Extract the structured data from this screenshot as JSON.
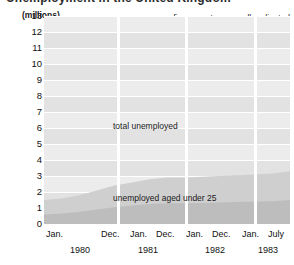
{
  "top_heading_clipped": "Unemployment in the United Kingdom",
  "chart_data": {
    "type": "area",
    "title": "",
    "subtitle": "",
    "note": "figures not seasonally adjusted",
    "ylabel": "(millions)",
    "xlabel": "",
    "ylim": [
      0,
      13
    ],
    "grid": true,
    "legend_position": "inline",
    "y_ticks": [
      "13",
      "12",
      "11",
      "10",
      "9",
      "8",
      "7",
      "6",
      "5",
      "4",
      "3",
      "2",
      "1",
      "0"
    ],
    "y_tick_values": [
      13,
      12,
      11,
      10,
      9,
      8,
      7,
      6,
      5,
      4,
      3,
      2,
      1,
      0
    ],
    "x_tick_labels": [
      "Jan.",
      "Dec.",
      "Jan.",
      "Dec.",
      "Jan.",
      "Dec.",
      "Jan.",
      "July"
    ],
    "x_panel_labels": [
      "1980",
      "1981",
      "1982",
      "1983"
    ],
    "x_axis_range_start": "Jan. 1980",
    "x_axis_range_end": "July 1983",
    "series": [
      {
        "name": "total unemployed",
        "label": "total unemployed",
        "color": "#cfcfcf",
        "x": [
          "Jan 1980",
          "Apr 1980",
          "Jul 1980",
          "Oct 1980",
          "Jan 1981",
          "Apr 1981",
          "Jul 1981",
          "Oct 1981",
          "Jan 1982",
          "Apr 1982",
          "Jul 1982",
          "Oct 1982",
          "Jan 1983",
          "Apr 1983",
          "Jul 1983"
        ],
        "values": [
          1.5,
          1.6,
          1.8,
          2.1,
          2.4,
          2.6,
          2.8,
          2.9,
          2.9,
          2.95,
          3.0,
          3.05,
          3.1,
          3.15,
          3.3
        ]
      },
      {
        "name": "unemployed aged under 25",
        "label": "unemployed aged under 25",
        "color": "#bdbdbd",
        "x": [
          "Jan 1980",
          "Apr 1980",
          "Jul 1980",
          "Oct 1980",
          "Jan 1981",
          "Apr 1981",
          "Jul 1981",
          "Oct 1981",
          "Jan 1982",
          "Apr 1982",
          "Jul 1982",
          "Oct 1982",
          "Jan 1983",
          "Apr 1983",
          "Jul 1983"
        ],
        "values": [
          0.6,
          0.65,
          0.75,
          0.9,
          1.05,
          1.15,
          1.25,
          1.3,
          1.3,
          1.32,
          1.35,
          1.37,
          1.4,
          1.42,
          1.5
        ]
      }
    ],
    "colors": {
      "plot_background": "#e2e2e2",
      "band_light": "#ececec",
      "gridline": "#ffffff",
      "total_area": "#cfcfcf",
      "under25_area": "#bdbdbd",
      "text": "#111111"
    }
  }
}
